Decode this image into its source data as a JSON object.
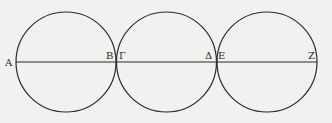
{
  "diagram": {
    "type": "three tangent circles with common diameter line",
    "colors": {
      "background": "#f1f1ef",
      "stroke": "#2a2a2a"
    },
    "circles": [
      {
        "cx": 66,
        "cy": 62,
        "r": 50
      },
      {
        "cx": 166.5,
        "cy": 62,
        "r": 50
      },
      {
        "cx": 267,
        "cy": 62,
        "r": 50
      }
    ],
    "line": {
      "x1": 16,
      "y1": 62,
      "x2": 317,
      "y2": 62
    },
    "labels": [
      {
        "id": "A",
        "text": "A",
        "x": 5,
        "y": 68
      },
      {
        "id": "B",
        "text": "B",
        "x": 106,
        "y": 60
      },
      {
        "id": "Gamma",
        "text": "Γ",
        "x": 119,
        "y": 60
      },
      {
        "id": "Delta",
        "text": "Δ",
        "x": 205,
        "y": 60
      },
      {
        "id": "E",
        "text": "E",
        "x": 218,
        "y": 60
      },
      {
        "id": "Z",
        "text": "Z",
        "x": 307,
        "y": 60
      }
    ]
  }
}
